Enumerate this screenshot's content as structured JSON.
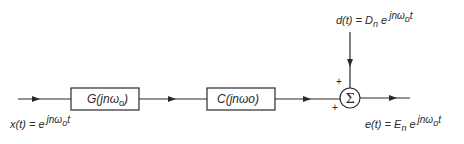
{
  "diagram": {
    "type": "block-diagram",
    "input": {
      "label_prefix": "x(t) = e",
      "label_exponent": "jnω",
      "label_exponent_sub": "o",
      "label_exponent_tail": "t"
    },
    "blocks": [
      {
        "id": "G",
        "label": "G(jnω",
        "label_sub": "o",
        "label_tail": ")"
      },
      {
        "id": "C",
        "label": "C(jnωo)"
      }
    ],
    "summing_junction": {
      "symbol": "Σ",
      "input_signs": [
        "+",
        "+"
      ]
    },
    "disturbance": {
      "label_prefix": "d(t) = D",
      "label_prefix_sub": "n",
      "label_mid": " e",
      "label_exponent": "jnω",
      "label_exponent_sub": "o",
      "label_exponent_tail": "t"
    },
    "output": {
      "label_prefix": "e(t) = E",
      "label_prefix_sub": "n",
      "label_mid": " e",
      "label_exponent": "jnω",
      "label_exponent_sub": "o",
      "label_exponent_tail": "t"
    },
    "colors": {
      "line": "#2a2a2a",
      "background": "#ffffff"
    }
  }
}
